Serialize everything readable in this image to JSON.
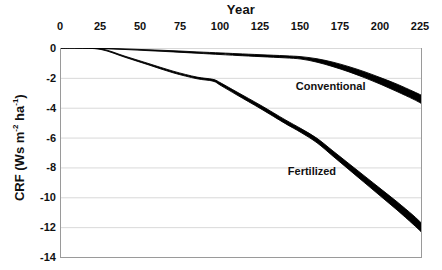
{
  "chart_data": {
    "type": "line",
    "title": "Year",
    "xlabel": "Year",
    "ylabel": "CRF (Ws m-2 ha-1)",
    "ylabel_parts": {
      "prefix": "CRF (Ws m",
      "sup1": "-2",
      "middle": " ha",
      "sup2": "-1",
      "suffix": ")"
    },
    "xlim": [
      0,
      225
    ],
    "ylim": [
      -14,
      0
    ],
    "xticks": [
      0,
      25,
      50,
      75,
      100,
      125,
      150,
      175,
      200,
      225
    ],
    "xtick_labels": [
      "0",
      "25",
      "50",
      "75",
      "100",
      "125",
      "150",
      "175",
      "200",
      "225"
    ],
    "yticks": [
      0,
      -2,
      -4,
      -6,
      -8,
      -10,
      -12,
      -14
    ],
    "ytick_labels": [
      "0",
      "-2",
      "-4",
      "-6",
      "-8",
      "-10",
      "-12",
      "-14"
    ],
    "xaxis_position": "top",
    "grid": "horizontal",
    "grid_color": "#d9d9d9",
    "axis_color": "#9a9a9a",
    "series_color": "#000000",
    "legend": "inline-annotations",
    "annotations": [
      {
        "name": "Conventional",
        "x": 168,
        "y": -2.6
      },
      {
        "name": "Fertilized",
        "x": 158,
        "y": -8.3
      }
    ],
    "series": [
      {
        "name": "Conventional",
        "style": "band",
        "x": [
          0,
          10,
          25,
          40,
          55,
          70,
          85,
          100,
          110,
          125,
          140,
          150,
          160,
          170,
          180,
          190,
          200,
          210,
          220,
          225
        ],
        "upper": [
          0.0,
          0.0,
          -0.02,
          -0.06,
          -0.12,
          -0.18,
          -0.26,
          -0.33,
          -0.38,
          -0.45,
          -0.52,
          -0.58,
          -0.72,
          -0.95,
          -1.25,
          -1.6,
          -2.0,
          -2.42,
          -2.9,
          -3.15
        ],
        "lower": [
          0.0,
          0.0,
          -0.04,
          -0.1,
          -0.18,
          -0.26,
          -0.35,
          -0.44,
          -0.5,
          -0.58,
          -0.66,
          -0.74,
          -0.95,
          -1.25,
          -1.6,
          -2.0,
          -2.44,
          -2.92,
          -3.42,
          -3.7
        ]
      },
      {
        "name": "Fertilized",
        "style": "band",
        "x": [
          0,
          10,
          25,
          40,
          55,
          70,
          85,
          95,
          100,
          110,
          125,
          140,
          150,
          160,
          170,
          180,
          190,
          200,
          210,
          220,
          225
        ],
        "upper": [
          0.0,
          0.0,
          -0.05,
          -0.55,
          -1.05,
          -1.55,
          -1.95,
          -2.1,
          -2.35,
          -2.95,
          -3.85,
          -4.8,
          -5.4,
          -6.05,
          -6.9,
          -7.75,
          -8.6,
          -9.45,
          -10.3,
          -11.2,
          -11.7
        ],
        "lower": [
          0.0,
          0.0,
          -0.1,
          -0.62,
          -1.14,
          -1.66,
          -2.06,
          -2.22,
          -2.52,
          -3.15,
          -4.08,
          -5.05,
          -5.66,
          -6.35,
          -7.25,
          -8.15,
          -9.05,
          -9.95,
          -10.85,
          -11.8,
          -12.3
        ]
      }
    ]
  }
}
